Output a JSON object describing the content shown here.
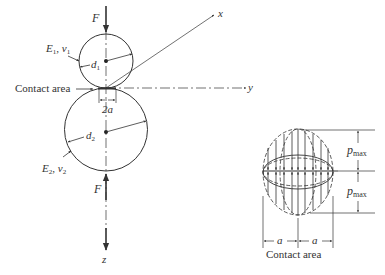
{
  "left_figure": {
    "force_top": "F",
    "force_bottom": "F",
    "material_1": "E",
    "material_1_sub": "1",
    "material_1_nu": "ν",
    "material_1_nu_sub": "1",
    "material_2": "E",
    "material_2_sub": "2",
    "material_2_nu": "ν",
    "material_2_nu_sub": "2",
    "diameter_1": "d",
    "diameter_1_sub": "1",
    "diameter_2": "d",
    "diameter_2_sub": "2",
    "contact_label": "Contact area",
    "contact_width": "2a",
    "axis_x": "x",
    "axis_y": "y",
    "axis_z": "z"
  },
  "right_figure": {
    "pmax_top": "p",
    "pmax_top_sub": "max",
    "pmax_bottom": "p",
    "pmax_bottom_sub": "max",
    "half_width_left": "a",
    "half_width_right": "a",
    "caption": "Contact area"
  },
  "colors": {
    "line": "#333333",
    "background": "#ffffff"
  }
}
